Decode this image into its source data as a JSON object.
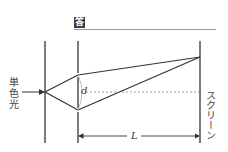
{
  "header": {
    "answer_badge": "答"
  },
  "labels": {
    "light_source": "単色光",
    "slit_separation": "d",
    "distance": "L",
    "screen": "スクリーン"
  },
  "geometry": {
    "source_barrier_x": 45,
    "slit_barrier_x": 78,
    "screen_x": 200,
    "barrier_top_y": 41,
    "barrier_bottom_y": 143,
    "source_point": [
      45,
      92
    ],
    "slit_1": [
      78,
      75
    ],
    "slit_2": [
      78,
      110
    ],
    "screen_point": [
      200,
      57
    ],
    "center_line_y": 92,
    "dimension_arrow_y": 136
  },
  "colors": {
    "line": "#333333",
    "dashed": "#888888",
    "arc": "#aaaaaa",
    "badge_bg": "#3a3a3a"
  }
}
